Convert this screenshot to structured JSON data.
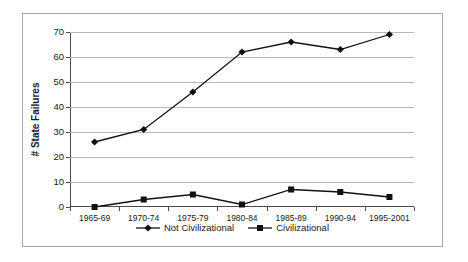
{
  "chart_data": {
    "type": "line",
    "title": "",
    "xlabel": "",
    "ylabel": "# State Failures",
    "categories": [
      "1965-69",
      "1970-74",
      "1975-79",
      "1980-84",
      "1985-89",
      "1990-94",
      "1995-2001"
    ],
    "ylim": [
      0,
      70
    ],
    "ytick_values": [
      0,
      10,
      20,
      30,
      40,
      50,
      60,
      70
    ],
    "ytick_labels": [
      "0",
      "10",
      "20",
      "30",
      "40",
      "50",
      "60",
      "70"
    ],
    "grid": true,
    "legend_position": "bottom",
    "series": [
      {
        "name": "Not Civilizational",
        "marker": "diamond",
        "color": "#111111",
        "values": [
          26,
          31,
          46,
          62,
          66,
          63,
          69
        ]
      },
      {
        "name": "Civilizational",
        "marker": "square",
        "color": "#111111",
        "values": [
          0,
          3,
          5,
          1,
          7,
          6,
          4
        ]
      }
    ]
  },
  "colors": {
    "axis": "#4a4a4a",
    "grid": "#b9b9b9",
    "border": "#a8a8a8",
    "text": "#1a1a1a",
    "background": "#ffffff"
  }
}
